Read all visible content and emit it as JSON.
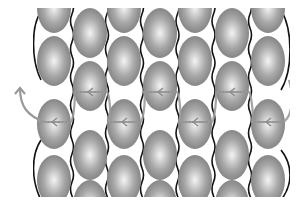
{
  "diagram": {
    "type": "peyote-stitch-beadwork",
    "width": 308,
    "height": 207,
    "clip": {
      "x": 33,
      "y": 8,
      "w": 257,
      "h": 189
    },
    "colors": {
      "background": "#ffffff",
      "bead_light": "#f4f4f4",
      "bead_mid": "#a8a8a8",
      "bead_dark": "#7d7d7d",
      "thread_existing": "#111111",
      "thread_new": "#9a9a9a",
      "arrow": "#8a8a8a"
    },
    "bead": {
      "rx": 17,
      "ry": 25
    },
    "columns": [
      {
        "x": 54,
        "beads_y": [
          8,
          61,
          124,
          180
        ]
      },
      {
        "x": 90,
        "beads_y": [
          33,
          86,
          155,
          205
        ]
      },
      {
        "x": 124,
        "beads_y": [
          8,
          61,
          124,
          180
        ]
      },
      {
        "x": 160,
        "beads_y": [
          33,
          86,
          155,
          205
        ]
      },
      {
        "x": 195,
        "beads_y": [
          8,
          61,
          124,
          180
        ]
      },
      {
        "x": 232,
        "beads_y": [
          33,
          86,
          155,
          205
        ]
      },
      {
        "x": 268,
        "beads_y": [
          8,
          61,
          124,
          180
        ]
      }
    ],
    "new_row_path": {
      "direction": "right-to-left",
      "arrow_rows_y": [
        92,
        122
      ],
      "exit_arrow": {
        "from": [
          45,
          122
        ],
        "to": [
          20,
          88
        ],
        "label": "up-arrow"
      }
    }
  }
}
